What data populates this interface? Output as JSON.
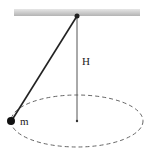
{
  "diagram": {
    "type": "conical-pendulum",
    "labels": {
      "height": "H",
      "mass": "m"
    },
    "elements": {
      "ceiling": "hatched support bar",
      "string": "line from pivot to mass",
      "axis": "vertical line from pivot to circle center",
      "path": "dashed circular path (ellipse in perspective)"
    },
    "colors": {
      "ceiling": "#c8c8c8",
      "line": "#333333",
      "mass": "#111111",
      "dashed": "#666666"
    }
  }
}
